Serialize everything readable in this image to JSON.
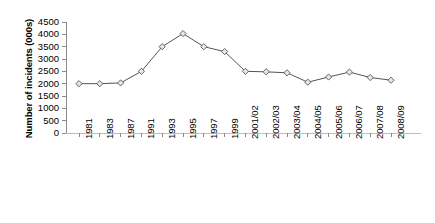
{
  "chart_data": {
    "type": "line",
    "title": "",
    "xlabel": "",
    "ylabel": "Number of incidents (000s)",
    "ylim": [
      0,
      4500
    ],
    "ytick_values": [
      0,
      500,
      1000,
      1500,
      2000,
      2500,
      3000,
      3500,
      4000,
      4500
    ],
    "ytick_labels": [
      "0",
      "500",
      "1000",
      "1500",
      "2000",
      "2500",
      "3000",
      "3500",
      "4000",
      "4500"
    ],
    "grid": false,
    "legend": "none",
    "marker": "diamond",
    "categories": [
      "1981",
      "1983",
      "1987",
      "1991",
      "1993",
      "1995",
      "1997",
      "1999",
      "2001/02",
      "2002/03",
      "2003/04",
      "2004/05",
      "2005/06",
      "2006/07",
      "2007/08",
      "2008/09"
    ],
    "values": [
      2000,
      2000,
      2030,
      2500,
      3500,
      4030,
      3500,
      3300,
      2500,
      2480,
      2440,
      2060,
      2270,
      2470,
      2250,
      2140
    ],
    "series": [
      {
        "name": "Number of incidents",
        "values": [
          2000,
          2000,
          2030,
          2500,
          3500,
          4030,
          3500,
          3300,
          2500,
          2480,
          2440,
          2060,
          2270,
          2470,
          2250,
          2140
        ]
      }
    ],
    "line_color": "#555555",
    "marker_fill": "#e8e8e8",
    "marker_edge": "#555555",
    "axis_color": "#8a8a8a"
  }
}
